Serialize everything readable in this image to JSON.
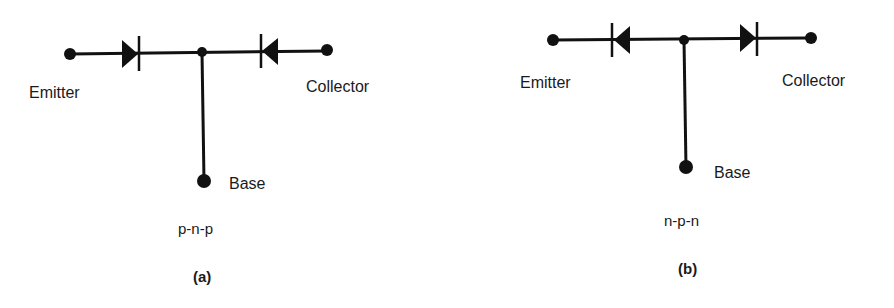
{
  "diagrams": [
    {
      "id": "a",
      "caption": "(a)",
      "type_label": "p-n-p",
      "terminals": {
        "emitter": "Emitter",
        "collector": "Collector",
        "base": "Base"
      },
      "diodes": [
        {
          "position": "emitter-side",
          "direction": "right",
          "description": "anode at emitter, cathode toward base"
        },
        {
          "position": "collector-side",
          "direction": "left",
          "description": "anode at collector, cathode toward base"
        }
      ]
    },
    {
      "id": "b",
      "caption": "(b)",
      "type_label": "n-p-n",
      "terminals": {
        "emitter": "Emitter",
        "collector": "Collector",
        "base": "Base"
      },
      "diodes": [
        {
          "position": "emitter-side",
          "direction": "left",
          "description": "cathode at emitter, anode toward base"
        },
        {
          "position": "collector-side",
          "direction": "right",
          "description": "anode toward base, cathode at collector"
        }
      ]
    }
  ],
  "colors": {
    "ink": "#111111",
    "background": "#ffffff"
  }
}
